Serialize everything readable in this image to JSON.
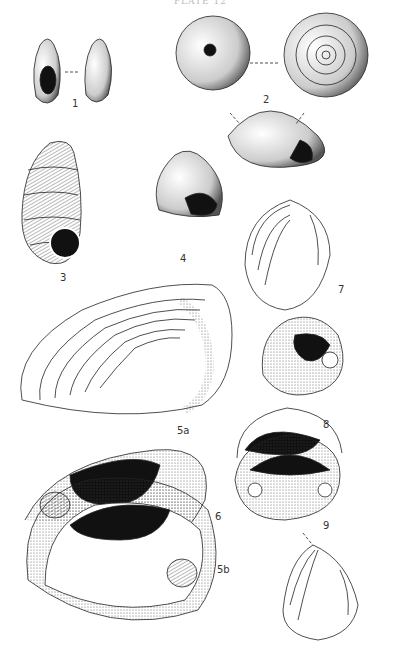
{
  "plate": {
    "header": "PLATE 12",
    "figures": [
      {
        "id": "fig-1",
        "label": "1",
        "kind": "gastropod-pair"
      },
      {
        "id": "fig-2",
        "label": "2",
        "kind": "discoid-snail-three-views"
      },
      {
        "id": "fig-3",
        "label": "3",
        "kind": "pupiform-snail"
      },
      {
        "id": "fig-4",
        "label": "4",
        "kind": "conical-snail"
      },
      {
        "id": "fig-5a",
        "label": "5a",
        "kind": "bivalve-exterior"
      },
      {
        "id": "fig-5b",
        "label": "5b",
        "kind": "bivalve-interior"
      },
      {
        "id": "fig-6",
        "label": "6",
        "kind": "bivalve-interior"
      },
      {
        "id": "fig-7",
        "label": "7",
        "kind": "clam-exterior-interior"
      },
      {
        "id": "fig-8",
        "label": "8",
        "kind": "clam-hinge"
      },
      {
        "id": "fig-9",
        "label": "9",
        "kind": "clam-interior-exterior"
      }
    ]
  }
}
